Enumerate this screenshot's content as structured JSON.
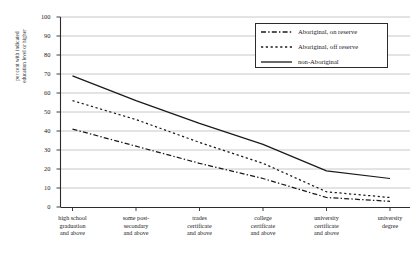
{
  "chart_data": {
    "type": "line",
    "title": "",
    "xlabel": "",
    "ylabel": "per cent with indicated education level or higher",
    "ylabel_lines": [
      "per cent with indicated",
      "education level or higher"
    ],
    "ylim": [
      0,
      100
    ],
    "ytick_values": [
      0,
      10,
      20,
      30,
      40,
      50,
      60,
      70,
      80,
      90,
      100
    ],
    "ytick_labels": [
      "0",
      "10",
      "20",
      "30",
      "40",
      "50",
      "60",
      "70",
      "80",
      "90",
      "100"
    ],
    "grid": true,
    "legend_position": "top-right",
    "categories": [
      "high school graduation and above",
      "some post-secondary and above",
      "trades certificate and above",
      "college certificate and above",
      "university certificate and above",
      "university degree"
    ],
    "category_lines": [
      [
        "high school",
        "graduation",
        "and above"
      ],
      [
        "some post-",
        "secondary",
        "and above"
      ],
      [
        "trades",
        "certificate",
        "and above"
      ],
      [
        "college",
        "certificate",
        "and above"
      ],
      [
        "university",
        "certificate",
        "and above"
      ],
      [
        "university",
        "degree"
      ]
    ],
    "series": [
      {
        "name": "Aboriginal, on reserve",
        "style": "dash-dot",
        "color": "#1a1a1a",
        "values": [
          41,
          32,
          23,
          15,
          5,
          3
        ]
      },
      {
        "name": "Aboriginal, off reserve",
        "style": "dotted",
        "color": "#1a1a1a",
        "values": [
          56,
          46,
          34,
          23,
          8,
          5
        ]
      },
      {
        "name": "non-Aboriginal",
        "style": "solid",
        "color": "#1a1a1a",
        "values": [
          69,
          56,
          44,
          33,
          19,
          15
        ]
      }
    ]
  },
  "legend": {
    "entries": [
      {
        "label": "Aboriginal, on reserve",
        "style": "dash-dot"
      },
      {
        "label": "Aboriginal, off reserve",
        "style": "dotted"
      },
      {
        "label": "non-Aboriginal",
        "style": "solid"
      }
    ]
  },
  "colors": {
    "line": "#1a1a1a",
    "grid": "#9a9a9a",
    "axis": "#2b2b2b",
    "background": "#ffffff"
  }
}
